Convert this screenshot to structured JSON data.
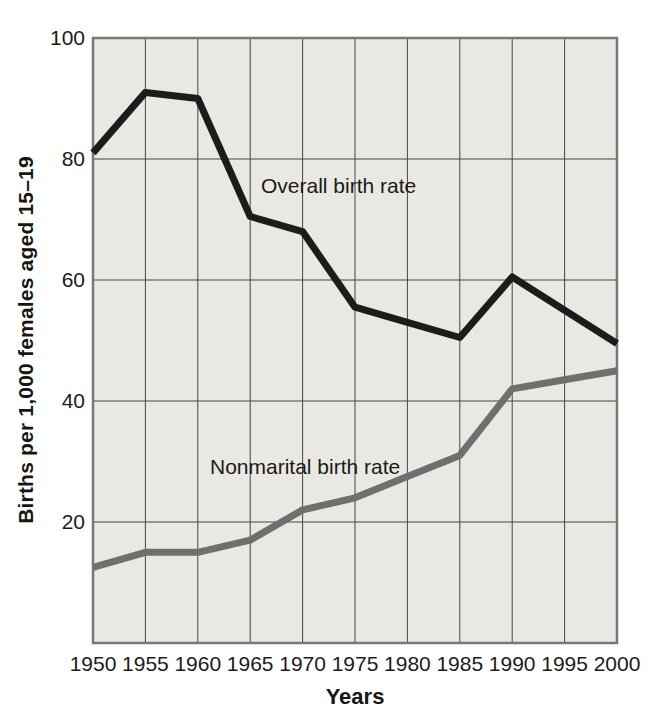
{
  "figure": {
    "background": "#ffffff",
    "plot_background": "#e9e8e3",
    "grid_color": "#454545",
    "border_color": "#787878",
    "text_color": "#161616"
  },
  "chart_data": {
    "type": "line",
    "title": "",
    "xlabel": "Years",
    "ylabel": "Births per 1,000 females aged 15–19",
    "x": [
      1950,
      1955,
      1960,
      1965,
      1970,
      1975,
      1980,
      1985,
      1990,
      1995,
      2000
    ],
    "x_tick_labels": [
      "1950",
      "1955",
      "1960",
      "1965",
      "1970",
      "1975",
      "1980",
      "1985",
      "1990",
      "1995",
      "2000"
    ],
    "y_ticks": [
      20,
      40,
      60,
      80,
      100
    ],
    "y_tick_labels": [
      "20",
      "40",
      "60",
      "80",
      "100"
    ],
    "ylim": [
      0,
      100
    ],
    "grid": true,
    "legend_position": "inline-annotations",
    "series": [
      {
        "name": "Overall birth rate",
        "color": "#1c1c1c",
        "values": [
          81,
          91,
          90,
          70.5,
          68,
          55.5,
          53,
          50.5,
          60.5,
          55,
          49.5
        ]
      },
      {
        "name": "Nonmarital birth rate",
        "color": "#6f6f6f",
        "values": [
          12.5,
          15,
          15,
          17,
          22,
          24,
          27.5,
          31,
          42,
          43.5,
          45
        ]
      }
    ]
  }
}
